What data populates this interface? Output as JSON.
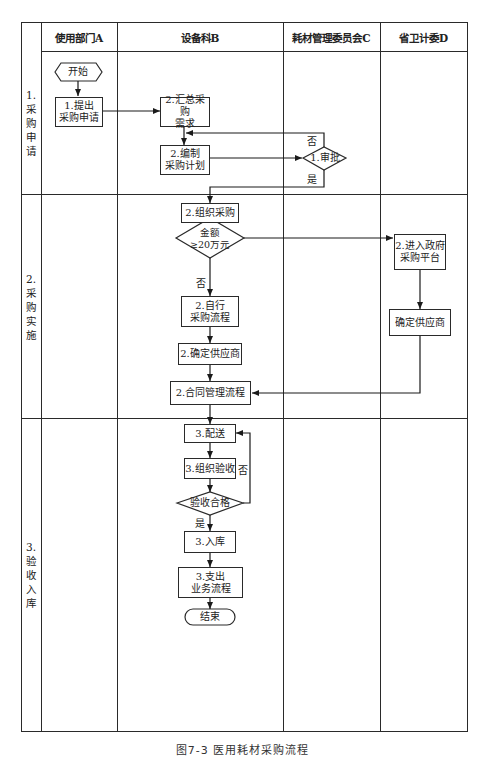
{
  "lanes": [
    {
      "id": "A",
      "label": "使用部门A"
    },
    {
      "id": "B",
      "label": "设备科B"
    },
    {
      "id": "C",
      "label": "耗材管理委员会C"
    },
    {
      "id": "D",
      "label": "省卫计委D"
    }
  ],
  "phases": [
    {
      "number": "1.",
      "chars": [
        "采",
        "购",
        "申",
        "请"
      ]
    },
    {
      "number": "2.",
      "chars": [
        "采",
        "购",
        "实",
        "施"
      ]
    },
    {
      "number": "3.",
      "chars": [
        "验",
        "收",
        "入",
        "库"
      ]
    }
  ],
  "nodes": {
    "start": "开始",
    "submit_request": "1.提出\n采购申请",
    "summarize_demand": "2.汇总采购\n需求",
    "compile_plan": "2.编制\n采购计划",
    "approval": "1.审批",
    "organize_purchase": "2.组织采购",
    "amount_check": "金额\n≥20万元",
    "self_purchase": "2.自行\n采购流程",
    "confirm_supplier_b": "2.确定供应商",
    "contract_mgmt": "2.合同管理流程",
    "gov_platform": "2.进入政府\n采购平台",
    "confirm_supplier_d": "确定供应商",
    "delivery": "3.配送",
    "organize_acceptance": "3.组织验收",
    "acceptance_ok": "验收合格",
    "warehousing": "3.入库",
    "payment": "3.支出\n业务流程",
    "end": "结束"
  },
  "edge_labels": {
    "approval_no": "否",
    "approval_yes": "是",
    "amount_no": "否",
    "acceptance_no": "否",
    "acceptance_yes": "是"
  },
  "caption": "图7-3  医用耗材采购流程"
}
